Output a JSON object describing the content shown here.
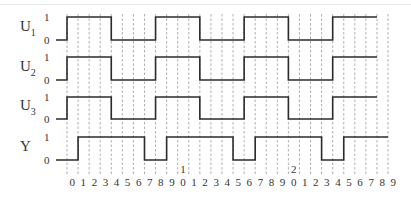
{
  "diagram": {
    "title": "",
    "signals": [
      {
        "name": "U",
        "subscript": "1",
        "high_label": "1",
        "low_label": "0",
        "levels": [
          0,
          1,
          1,
          1,
          1,
          0,
          0,
          0,
          0,
          1,
          1,
          1,
          1,
          0,
          0,
          0,
          0,
          1,
          1,
          1,
          1,
          0,
          0,
          0,
          0,
          1,
          1,
          1,
          1
        ]
      },
      {
        "name": "U",
        "subscript": "2",
        "high_label": "1",
        "low_label": "0",
        "levels": [
          0,
          1,
          1,
          1,
          1,
          0,
          0,
          0,
          0,
          1,
          1,
          1,
          1,
          0,
          0,
          0,
          0,
          1,
          1,
          1,
          1,
          0,
          0,
          0,
          0,
          1,
          1,
          1,
          1
        ]
      },
      {
        "name": "U",
        "subscript": "3",
        "high_label": "1",
        "low_label": "0",
        "levels": [
          0,
          1,
          1,
          1,
          1,
          0,
          0,
          0,
          0,
          1,
          1,
          1,
          1,
          0,
          0,
          0,
          0,
          1,
          1,
          1,
          1,
          0,
          0,
          0,
          0,
          1,
          1,
          1,
          1
        ]
      },
      {
        "name": "Y",
        "subscript": "",
        "high_label": "1",
        "low_label": "0",
        "levels": [
          0,
          0,
          1,
          1,
          1,
          1,
          1,
          1,
          0,
          0,
          1,
          1,
          1,
          1,
          1,
          1,
          0,
          0,
          1,
          1,
          1,
          1,
          1,
          1,
          0,
          0,
          1,
          1,
          1,
          1
        ]
      }
    ],
    "tick_labels": [
      "0",
      "1",
      "2",
      "3",
      "4",
      "5",
      "6",
      "7",
      "8",
      "9",
      "0",
      "1",
      "2",
      "3",
      "4",
      "5",
      "6",
      "7",
      "8",
      "9",
      "0",
      "1",
      "2",
      "3",
      "4",
      "5",
      "6",
      "7",
      "8",
      "9"
    ],
    "decade_markers": [
      {
        "index": 10,
        "label": "1"
      },
      {
        "index": 20,
        "label": "2"
      }
    ]
  }
}
